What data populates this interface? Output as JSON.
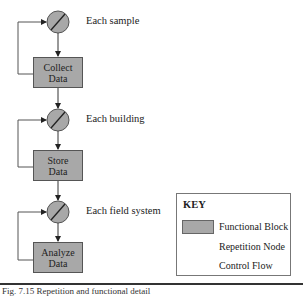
{
  "diagram": {
    "stages": [
      {
        "loop_label": "Each sample",
        "block_line1": "Collect",
        "block_line2": "Data"
      },
      {
        "loop_label": "Each building",
        "block_line1": "Store",
        "block_line2": "Data"
      },
      {
        "loop_label": "Each field system",
        "block_line1": "Analyze",
        "block_line2": "Data"
      }
    ],
    "colors": {
      "block_fill": "#a8a8a8",
      "node_fill": "#a8a8a8",
      "line": "#444444"
    }
  },
  "key": {
    "title": "KEY",
    "items": [
      {
        "symbol": "functional-block",
        "label": "Functional Block"
      },
      {
        "symbol": "repetition-node",
        "label": "Repetition Node"
      },
      {
        "symbol": "control-flow-arrow",
        "label": "Control Flow"
      }
    ]
  },
  "caption": {
    "text": "Fig. 7.15   Repetition and functional detail"
  }
}
